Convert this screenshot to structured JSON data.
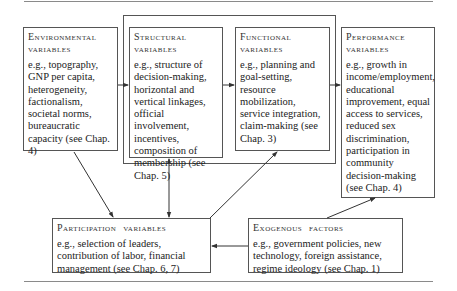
{
  "diagram": {
    "boxes": {
      "environmental": {
        "title_line1": "Environmental",
        "title_line2": "variables",
        "body": "e.g., topography, GNP per capita, heterogeneity, factionalism, societal norms, bureaucratic capacity (see Chap. 4)"
      },
      "structural": {
        "title_line1": "Structural",
        "title_line2": "variables",
        "body": "e.g., structure of decision-making, horizontal and vertical linkages, official involvement, incentives, composition of membership (see Chap. 5)"
      },
      "functional": {
        "title_line1": "Functional",
        "title_line2": "variables",
        "body": "e.g., planning and goal-setting, resource mobilization, service integration, claim-making (see Chap. 3)"
      },
      "performance": {
        "title_line1": "Performance",
        "title_line2": "variables",
        "body": "e.g., growth in income/employment, educational improvement, equal access to services, reduced sex discrimination, participation in community decision-making (see Chap. 4)"
      },
      "participation": {
        "title": "Participation variables",
        "body": "e.g., selection of leaders, contribution of labor, financial management (see Chap. 6, 7)"
      },
      "exogenous": {
        "title": "Exogenous factors",
        "body": "e.g., government policies, new technology, foreign assistance, regime ideology (see Chap. 1)"
      }
    },
    "edges": [
      {
        "from": "environmental",
        "to": "structural"
      },
      {
        "from": "structural",
        "to": "functional"
      },
      {
        "from": "functional",
        "to": "performance"
      },
      {
        "from": "environmental",
        "to": "participation"
      },
      {
        "from": "structural",
        "to": "participation",
        "bidirectional": true
      },
      {
        "from": "participation",
        "to": "functional"
      },
      {
        "from": "exogenous",
        "to": "participation"
      },
      {
        "from": "exogenous",
        "to": "performance"
      }
    ],
    "colors": {
      "line": "#333333",
      "border": "#555555",
      "text": "#222222"
    }
  }
}
